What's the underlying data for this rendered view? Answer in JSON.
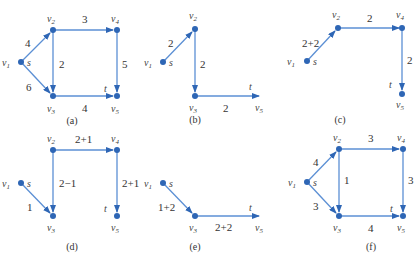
{
  "figure": {
    "panels": [
      {
        "caption": "(a)",
        "source_label": "s",
        "sink_label": "t",
        "nodes": [
          "v1",
          "v2",
          "v3",
          "v4",
          "v5"
        ],
        "edges": [
          {
            "from": "v1",
            "to": "v2",
            "label": "4"
          },
          {
            "from": "v1",
            "to": "v3",
            "label": "6"
          },
          {
            "from": "v2",
            "to": "v4",
            "label": "3"
          },
          {
            "from": "v2",
            "to": "v3",
            "label": "2"
          },
          {
            "from": "v4",
            "to": "v5",
            "label": "5"
          },
          {
            "from": "v3",
            "to": "v5",
            "label": "4"
          }
        ]
      },
      {
        "caption": "(b)",
        "source_label": "s",
        "sink_label": "t",
        "nodes": [
          "v1",
          "v2",
          "v3",
          "v5"
        ],
        "edges": [
          {
            "from": "v1",
            "to": "v2",
            "label": "2"
          },
          {
            "from": "v2",
            "to": "v3",
            "label": "2"
          },
          {
            "from": "v3",
            "to": "v5",
            "label": "2"
          }
        ]
      },
      {
        "caption": "(c)",
        "source_label": "s",
        "sink_label": "t",
        "nodes": [
          "v1",
          "v2",
          "v4",
          "v5"
        ],
        "edges": [
          {
            "from": "v1",
            "to": "v2",
            "label": "2+2"
          },
          {
            "from": "v2",
            "to": "v4",
            "label": "2"
          },
          {
            "from": "v4",
            "to": "v5",
            "label": "2"
          }
        ]
      },
      {
        "caption": "(d)",
        "source_label": "s",
        "sink_label": "t",
        "nodes": [
          "v1",
          "v2",
          "v3",
          "v4",
          "v5"
        ],
        "edges": [
          {
            "from": "v1",
            "to": "v3",
            "label": "1"
          },
          {
            "from": "v2",
            "to": "v4",
            "label": "2+1"
          },
          {
            "from": "v2",
            "to": "v3",
            "label": "2−1"
          },
          {
            "from": "v4",
            "to": "v5",
            "label": "2+1"
          }
        ]
      },
      {
        "caption": "(e)",
        "source_label": "s",
        "sink_label": "t",
        "nodes": [
          "v1",
          "v3",
          "v5"
        ],
        "edges": [
          {
            "from": "v1",
            "to": "v3",
            "label": "1+2"
          },
          {
            "from": "v3",
            "to": "v5",
            "label": "2+2"
          }
        ]
      },
      {
        "caption": "(f)",
        "source_label": "s",
        "sink_label": "t",
        "nodes": [
          "v1",
          "v2",
          "v3",
          "v4",
          "v5"
        ],
        "edges": [
          {
            "from": "v1",
            "to": "v2",
            "label": "4"
          },
          {
            "from": "v1",
            "to": "v3",
            "label": "3"
          },
          {
            "from": "v2",
            "to": "v4",
            "label": "3"
          },
          {
            "from": "v2",
            "to": "v3",
            "label": "1"
          },
          {
            "from": "v4",
            "to": "v5",
            "label": "3"
          },
          {
            "from": "v3",
            "to": "v5",
            "label": "4"
          }
        ]
      }
    ],
    "node_labels": {
      "v1": "v",
      "v2": "v",
      "v3": "v",
      "v4": "v",
      "v5": "v"
    },
    "subscripts": {
      "v1": "1",
      "v2": "2",
      "v3": "3",
      "v4": "4",
      "v5": "5"
    },
    "colors": {
      "edge": "#5b8fd4",
      "node": "#2e66b5",
      "text": "#333333"
    }
  }
}
